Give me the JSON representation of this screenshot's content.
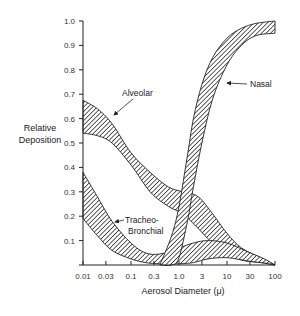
{
  "chart_data": {
    "type": "area",
    "title": "",
    "xlabel": "Aerosol Diameter (μ)",
    "ylabel": [
      "Relative",
      "Deposition"
    ],
    "xscale": "log",
    "xlim": [
      0.01,
      100
    ],
    "ylim": [
      0,
      1.0
    ],
    "grid": false,
    "legend": "inline labels with arrows",
    "x_ticks": [
      {
        "value": 0.01,
        "label": "0.01"
      },
      {
        "value": 0.03,
        "label": "0.03"
      },
      {
        "value": 0.1,
        "label": "0.1"
      },
      {
        "value": 0.3,
        "label": "0.3"
      },
      {
        "value": 1.0,
        "label": "1.0"
      },
      {
        "value": 3,
        "label": "3"
      },
      {
        "value": 10,
        "label": "10"
      },
      {
        "value": 30,
        "label": "30"
      },
      {
        "value": 100,
        "label": "100"
      }
    ],
    "y_ticks": [
      {
        "value": 0.1,
        "label": "0.1"
      },
      {
        "value": 0.2,
        "label": "0.2"
      },
      {
        "value": 0.3,
        "label": "0.3"
      },
      {
        "value": 0.4,
        "label": "0.4"
      },
      {
        "value": 0.5,
        "label": "0.5"
      },
      {
        "value": 0.6,
        "label": "0.6"
      },
      {
        "value": 0.7,
        "label": "0.7"
      },
      {
        "value": 0.8,
        "label": "0.8"
      },
      {
        "value": 0.9,
        "label": "0.9"
      },
      {
        "value": 1.0,
        "label": "1.0"
      }
    ],
    "series": [
      {
        "name": "Alveolar",
        "x": [
          0.01,
          0.02,
          0.04,
          0.1,
          0.25,
          0.6,
          1.2,
          2.5,
          5,
          10,
          20,
          50,
          100
        ],
        "upper": [
          0.675,
          0.64,
          0.58,
          0.46,
          0.38,
          0.32,
          0.3,
          0.28,
          0.21,
          0.13,
          0.07,
          0.03,
          0.0
        ],
        "lower": [
          0.54,
          0.53,
          0.5,
          0.41,
          0.3,
          0.24,
          0.21,
          0.15,
          0.09,
          0.05,
          0.02,
          0.01,
          0.0
        ]
      },
      {
        "name": "Tracheo-Bronchial",
        "x": [
          0.01,
          0.02,
          0.04,
          0.1,
          0.2,
          0.4,
          1,
          2,
          4,
          10,
          30,
          60,
          100
        ],
        "upper": [
          0.38,
          0.28,
          0.18,
          0.09,
          0.05,
          0.045,
          0.07,
          0.09,
          0.1,
          0.09,
          0.05,
          0.025,
          0.0
        ],
        "lower": [
          0.19,
          0.12,
          0.06,
          0.025,
          0.01,
          0.005,
          0.005,
          0.01,
          0.025,
          0.03,
          0.015,
          0.008,
          0.0
        ]
      },
      {
        "name": "Nasal",
        "x": [
          0.4,
          0.7,
          1.0,
          1.5,
          2,
          3,
          5,
          10,
          20,
          40,
          100
        ],
        "upper": [
          0.0,
          0.12,
          0.24,
          0.45,
          0.6,
          0.74,
          0.85,
          0.93,
          0.97,
          0.99,
          1.0
        ],
        "lower": [
          0.0,
          0.0,
          0.03,
          0.18,
          0.32,
          0.5,
          0.68,
          0.82,
          0.9,
          0.94,
          0.95
        ]
      }
    ],
    "annotations": [
      {
        "text": "Alveolar",
        "points_to": "Alveolar"
      },
      {
        "text": "Nasal",
        "points_to": "Nasal"
      },
      {
        "text": "Tracheo-",
        "text2": "Bronchial",
        "points_to": "Tracheo-Bronchial"
      }
    ]
  },
  "labels": {
    "ylabel_line1": "Relative",
    "ylabel_line2": "Deposition",
    "xlabel": "Aerosol Diameter (μ)",
    "alveolar": "Alveolar",
    "nasal": "Nasal",
    "tb_line1": "Tracheo-",
    "tb_line2": "Bronchial"
  },
  "style": {
    "stroke_color": "#222222",
    "hatch_color": "#2a2a2a",
    "background": "#ffffff"
  }
}
